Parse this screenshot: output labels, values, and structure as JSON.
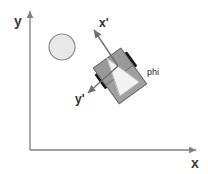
{
  "figure": {
    "background_color": "#ffffff",
    "width": 208,
    "height": 174
  },
  "global_frame": {
    "origin": {
      "x": 30,
      "y": 150
    },
    "axis_color": "#808080",
    "x_axis": {
      "label": "x",
      "label_pos": {
        "x": 191,
        "y": 168
      },
      "from": {
        "x": 30,
        "y": 150
      },
      "to": {
        "x": 196,
        "y": 150
      }
    },
    "y_axis": {
      "label": "y",
      "label_pos": {
        "x": 14,
        "y": 26
      },
      "from": {
        "x": 30,
        "y": 150
      },
      "to": {
        "x": 30,
        "y": 11
      }
    }
  },
  "body_frame": {
    "origin": {
      "x": 118,
      "y": 66
    },
    "arrow_color": "#6e6e6e",
    "x_prime_axis": {
      "label": "x'",
      "label_pos": {
        "x": 99,
        "y": 27
      },
      "from": {
        "x": 118,
        "y": 66
      },
      "to": {
        "x": 94,
        "y": 30
      }
    },
    "y_prime_axis": {
      "label": "y'",
      "label_pos": {
        "x": 75,
        "y": 103
      },
      "from": {
        "x": 118,
        "y": 66
      },
      "to": {
        "x": 88,
        "y": 93
      }
    }
  },
  "heading_angle": {
    "symbol": "phi",
    "label_pos": {
      "x": 147,
      "y": 75
    },
    "color": "#1f1f1f"
  },
  "obstacle": {
    "shape": "circle",
    "center": {
      "x": 62,
      "y": 47
    },
    "radius": 13,
    "fill_color": "#e8e8e8",
    "stroke_color": "#8a8a8a"
  },
  "robot": {
    "center": {
      "x": 120,
      "y": 76
    },
    "rotation_deg": -36,
    "body": {
      "fill_color": "#a0a0a0",
      "stroke_color": "#6a6a6a",
      "width": 34,
      "height": 44
    },
    "front_panel": {
      "fill_color": "#9a9a9a"
    },
    "rear_panel": {
      "fill_color": "#b4b4b4"
    },
    "sensor_cone": {
      "fill_color": "#f2f2f2",
      "stroke_color": "#cfcfcf"
    },
    "wheels": [
      {
        "name": "left-wheel",
        "fill_color": "#151515"
      },
      {
        "name": "right-wheel",
        "fill_color": "#151515"
      }
    ]
  }
}
